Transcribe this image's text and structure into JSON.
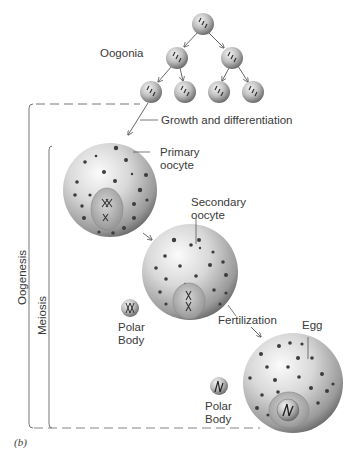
{
  "figure": {
    "panel_label": "(b)",
    "labels": {
      "oogonia": "Oogonia",
      "growth": "Growth and differentiation",
      "primary_oocyte_1": "Primary",
      "primary_oocyte_2": "oocyte",
      "secondary_oocyte_1": "Secondary",
      "secondary_oocyte_2": "oocyte",
      "polar_body_1a": "Polar",
      "polar_body_1b": "Body",
      "fertilization": "Fertilization",
      "egg": "Egg",
      "polar_body_2a": "Polar",
      "polar_body_2b": "Body"
    },
    "brackets": {
      "outer": "Oogenesis",
      "inner": "Meiosis"
    },
    "stages": [
      "Oogonia",
      "Primary oocyte",
      "Secondary oocyte",
      "Egg"
    ],
    "colors": {
      "cell_light": "#f2f2f2",
      "cell_dark": "#6e6e6e",
      "line": "#555555",
      "text": "#3a3a3a"
    }
  }
}
